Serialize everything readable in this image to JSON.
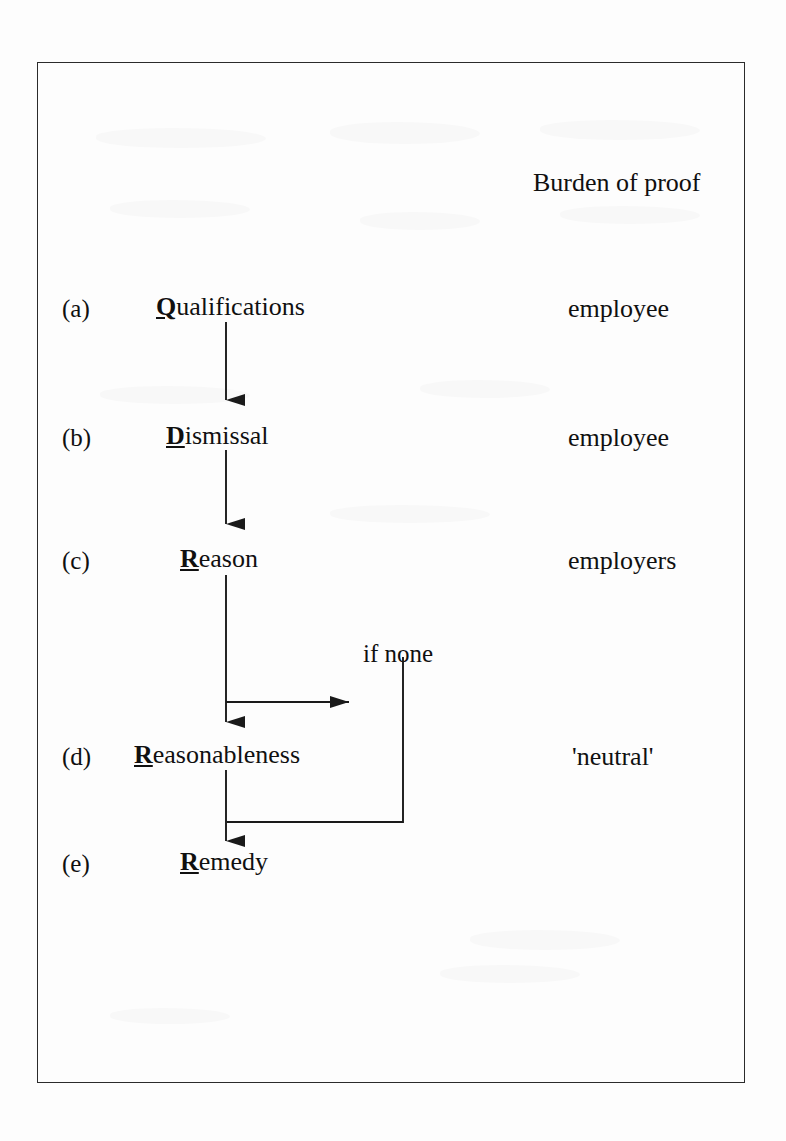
{
  "frame": {
    "border_color": "#2b2b2b",
    "background": "#fdfdfd"
  },
  "header": {
    "burden_column_title": "Burden of proof"
  },
  "diagram": {
    "type": "flowchart",
    "orientation": "vertical",
    "title": "Burden of proof",
    "stages": [
      {
        "key": "a",
        "label": "(a)",
        "initial": "Q",
        "rest": "ualifications",
        "full_name": "Qualifications",
        "burden": "employee"
      },
      {
        "key": "b",
        "label": "(b)",
        "initial": "D",
        "rest": "ismissal",
        "full_name": "Dismissal",
        "burden": "employee"
      },
      {
        "key": "c",
        "label": "(c)",
        "initial": "R",
        "rest": "eason",
        "full_name": "Reason",
        "burden": "employers"
      },
      {
        "key": "d",
        "label": "(d)",
        "initial": "R",
        "rest": "easonableness",
        "full_name": "Reasonableness",
        "burden": "'neutral'"
      },
      {
        "key": "e",
        "label": "(e)",
        "initial": "R",
        "rest": "emedy",
        "full_name": "Remedy",
        "burden": ""
      }
    ],
    "branch": {
      "note": "if none",
      "from_stage": "c",
      "to_stage": "e",
      "description": "if none, bypass Reasonableness and go to Remedy"
    },
    "connectors": [
      {
        "from": "a",
        "to": "b",
        "style": "arrow-down"
      },
      {
        "from": "b",
        "to": "c",
        "style": "arrow-down"
      },
      {
        "from": "c",
        "to": "d",
        "style": "arrow-down"
      },
      {
        "from": "c",
        "to": "branch",
        "style": "arrow-right"
      },
      {
        "from": "branch",
        "to": "e",
        "style": "elbow-down"
      },
      {
        "from": "d",
        "to": "e",
        "style": "arrow-down"
      }
    ]
  }
}
